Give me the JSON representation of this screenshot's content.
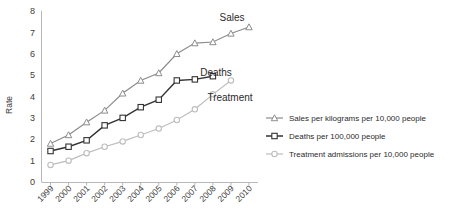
{
  "chart_data": {
    "type": "line",
    "title": "",
    "xlabel": "",
    "ylabel": "Rate",
    "ylim": [
      0,
      8
    ],
    "yticks": [
      0,
      1,
      2,
      3,
      4,
      5,
      6,
      7,
      8
    ],
    "grid": false,
    "legend_position": "right",
    "categories": [
      "1999",
      "2000",
      "2001",
      "2002",
      "2003",
      "2004",
      "2005",
      "2006",
      "2007",
      "2008",
      "2009",
      "2010"
    ],
    "series": [
      {
        "name": "Sales per kilograms per 10,000 people",
        "short_name": "Sales",
        "marker": "triangle",
        "color": "#8c8c8c",
        "values": [
          1.8,
          2.2,
          2.8,
          3.35,
          4.15,
          4.75,
          5.1,
          6.0,
          6.5,
          6.55,
          6.95,
          7.25
        ]
      },
      {
        "name": "Deaths per 100,000 people",
        "short_name": "Deaths",
        "marker": "square",
        "color": "#333333",
        "values": [
          1.45,
          1.65,
          1.95,
          2.65,
          3.0,
          3.5,
          3.85,
          4.75,
          4.8,
          4.95,
          null,
          null
        ]
      },
      {
        "name": "Treatment admissions per 10,000 people",
        "short_name": "Treatment",
        "marker": "circle",
        "color": "#bdbdbd",
        "values": [
          0.8,
          1.0,
          1.35,
          1.65,
          1.9,
          2.2,
          2.5,
          2.9,
          3.4,
          4.1,
          4.75,
          null
        ]
      }
    ],
    "annotations": [
      {
        "text": "Sales",
        "series": "Sales per kilograms per 10,000 people"
      },
      {
        "text": "Deaths",
        "series": "Deaths per 100,000 people"
      },
      {
        "text": "Treatment",
        "series": "Treatment admissions per 10,000 people"
      }
    ]
  },
  "yaxis": {
    "labels": [
      "8",
      "7",
      "6",
      "5",
      "4",
      "3",
      "2",
      "1",
      "0"
    ],
    "title": "Rate"
  },
  "xaxis": {
    "labels": [
      "1999",
      "2000",
      "2001",
      "2002",
      "2003",
      "2004",
      "2005",
      "2006",
      "2007",
      "2008",
      "2009",
      "2010"
    ]
  },
  "legend": {
    "entries": [
      {
        "label": "Sales per kilograms per 10,000 people",
        "marker": "triangle",
        "color": "#8c8c8c"
      },
      {
        "label": "Deaths per 100,000 people",
        "marker": "square",
        "color": "#333333"
      },
      {
        "label": "Treatment admissions per 10,000 people",
        "marker": "circle",
        "color": "#bdbdbd"
      }
    ]
  },
  "annotations": {
    "sales": "Sales",
    "deaths": "Deaths",
    "treatment": "Treatment"
  }
}
